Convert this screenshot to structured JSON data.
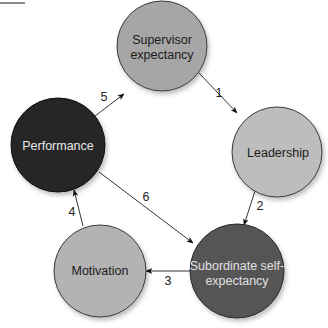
{
  "diagram": {
    "type": "cycle",
    "nodes": [
      {
        "id": "supervisor",
        "line1": "Supervisor",
        "line2": "expectancy",
        "fill": "#a6a6a6",
        "text_color": "#1a1a1a"
      },
      {
        "id": "leadership",
        "line1": "Leadership",
        "line2": "",
        "fill": "#bdbdbd",
        "text_color": "#1a1a1a"
      },
      {
        "id": "subordinate",
        "line1": "Subordinate self-",
        "line2": "expectancy",
        "fill": "#555555",
        "text_color": "#e0e0e0"
      },
      {
        "id": "motivation",
        "line1": "Motivation",
        "line2": "",
        "fill": "#b3b3b3",
        "text_color": "#1a1a1a"
      },
      {
        "id": "performance",
        "line1": "Performance",
        "line2": "",
        "fill": "#262626",
        "text_color": "#e8e8e8"
      }
    ],
    "edges": [
      {
        "from": "supervisor",
        "to": "leadership",
        "label": "1"
      },
      {
        "from": "leadership",
        "to": "subordinate",
        "label": "2"
      },
      {
        "from": "subordinate",
        "to": "motivation",
        "label": "3"
      },
      {
        "from": "motivation",
        "to": "performance",
        "label": "4"
      },
      {
        "from": "performance",
        "to": "supervisor",
        "label": "5"
      },
      {
        "from": "performance",
        "to": "subordinate",
        "label": "6"
      }
    ]
  }
}
